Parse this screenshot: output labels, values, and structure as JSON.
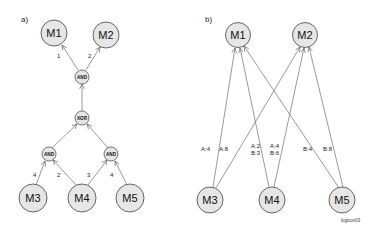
{
  "panel_a": {
    "label": "a)",
    "nodes": {
      "m1": "M1",
      "m2": "M2",
      "and_top": "AND",
      "xor": "XOR",
      "and_left": "AND",
      "and_right": "AND",
      "m3": "M3",
      "m4": "M4",
      "m5": "M5"
    },
    "edge_labels": {
      "and_to_m1": "1",
      "and_to_m2": "2",
      "m3_to_and_left": "4",
      "m4_to_and_left": "2",
      "m4_to_and_right": "3",
      "m5_to_and_right": "4"
    }
  },
  "panel_b": {
    "label": "b)",
    "nodes": {
      "m1": "M1",
      "m2": "M2",
      "m3": "M3",
      "m4": "M4",
      "m5": "M5"
    },
    "edge_labels": {
      "m3_to_m1": "A:4",
      "m3_to_m2": "A:8",
      "m4_to_m1_a": "A:2",
      "m4_to_m1_b": "B:3",
      "m4_to_m2_a": "A:4",
      "m4_to_m2_b": "B:6",
      "m5_to_m1": "B:4",
      "m5_to_m2": "B:8"
    }
  },
  "watermark": "logicon03"
}
